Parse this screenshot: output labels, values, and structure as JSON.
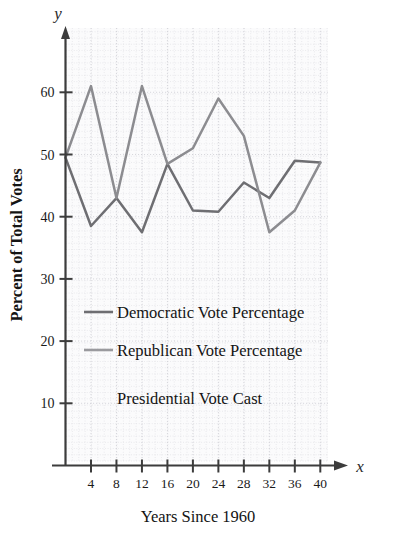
{
  "chart_data": {
    "type": "line",
    "title": "Presidential Vote Cast",
    "xlabel": "Years Since 1960",
    "ylabel": "Percent of Total Votes",
    "x_axis_letter": "x",
    "y_axis_letter": "y",
    "grid": true,
    "legend_position": "inside-lower-left",
    "xlim": [
      0,
      42
    ],
    "ylim": [
      0,
      64
    ],
    "x_ticks": [
      4,
      8,
      12,
      16,
      20,
      24,
      28,
      32,
      36,
      40
    ],
    "x_tick_labels": [
      "4",
      "8",
      "12",
      "16",
      "20",
      "24",
      "28",
      "32",
      "36",
      "40"
    ],
    "y_ticks": [
      10,
      20,
      30,
      40,
      50,
      60
    ],
    "y_tick_labels": [
      "10",
      "20",
      "30",
      "40",
      "50",
      "60"
    ],
    "x": [
      0,
      4,
      8,
      12,
      16,
      20,
      24,
      28,
      32,
      36,
      40
    ],
    "series": [
      {
        "name": "Democratic Vote Percentage",
        "color": "#6e6e72",
        "values": [
          49.5,
          38.5,
          43.0,
          37.5,
          48.5,
          41.0,
          40.8,
          45.5,
          43.0,
          49.0,
          48.7
        ]
      },
      {
        "name": "Republican Vote Percentage",
        "color": "#8c8c90",
        "values": [
          49.5,
          61.0,
          43.0,
          61.0,
          48.5,
          51.0,
          59.0,
          53.0,
          37.5,
          41.0,
          48.7
        ]
      }
    ]
  },
  "legend": {
    "entries": [
      {
        "label": "Democratic Vote Percentage",
        "swatch_color": "#6e6e72"
      },
      {
        "label": "Republican Vote Percentage",
        "swatch_color": "#9a9a9e"
      }
    ]
  },
  "colors": {
    "axis": "#3c3c3c",
    "grid": "#d9d9de",
    "plot_background": "#fbfbfc",
    "democratic": "#6e6e72",
    "republican": "#8c8c90",
    "text": "#141414"
  }
}
